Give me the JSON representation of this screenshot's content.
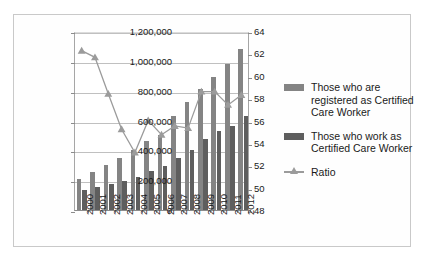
{
  "chart_data": {
    "type": "bar",
    "title": "",
    "xlabel": "",
    "ylabel": "",
    "grid": true,
    "legend_position": "right",
    "categories": [
      "2000",
      "2001",
      "2002",
      "2003",
      "2004",
      "2005",
      "2006",
      "2007",
      "2008",
      "2009",
      "2010",
      "2011",
      "2012"
    ],
    "left_axis": {
      "ylim": [
        0,
        1200000
      ],
      "ticks": [
        0,
        200000,
        400000,
        600000,
        800000,
        1000000,
        1200000
      ],
      "tick_labels": [
        "0",
        "200,000",
        "400,000",
        "600,000",
        "800,000",
        "1,000,000",
        "1,200,000"
      ]
    },
    "right_axis": {
      "ylim": [
        48,
        64
      ],
      "ticks": [
        48,
        50,
        52,
        54,
        56,
        58,
        60,
        62,
        64
      ],
      "tick_labels": [
        "48",
        "50",
        "52",
        "54",
        "56",
        "58",
        "60",
        "62",
        "64"
      ]
    },
    "series": [
      {
        "name": "Those who are registered as Certified Care Worker",
        "type": "bar",
        "axis": "left",
        "color": "#848484",
        "values": [
          210000,
          253000,
          300000,
          348000,
          400000,
          465000,
          500000,
          632000,
          727000,
          810000,
          893000,
          977000,
          1080000
        ]
      },
      {
        "name": "Those who work as Certified Care Worker",
        "type": "bar",
        "axis": "left",
        "color": "#5e5e5e",
        "values": [
          133000,
          152000,
          175000,
          193000,
          218000,
          260000,
          298000,
          352000,
          400000,
          473000,
          527000,
          565000,
          632000
        ]
      },
      {
        "name": "Ratio",
        "type": "line",
        "axis": "right",
        "color": "#9b9b9b",
        "marker": "triangle",
        "values": [
          62.4,
          61.8,
          58.5,
          55.3,
          53.2,
          56.1,
          54.8,
          55.6,
          55.4,
          58.7,
          58.7,
          57.5,
          58.4
        ]
      }
    ]
  },
  "legend": {
    "items": [
      {
        "label": "Those who are registered as Certified Care Worker",
        "marker": "bar-swatch-light"
      },
      {
        "label": "Those who work as Certified Care Worker",
        "marker": "bar-swatch-dark"
      },
      {
        "label": "Ratio",
        "marker": "line-triangle"
      }
    ]
  },
  "colors": {
    "bar_registered": "#848484",
    "bar_working": "#5e5e5e",
    "ratio_line": "#9b9b9b",
    "gridline": "#c0c0c0",
    "axis": "#8c8c8c",
    "frame_border": "#c9c9c9",
    "background": "#ffffff"
  }
}
